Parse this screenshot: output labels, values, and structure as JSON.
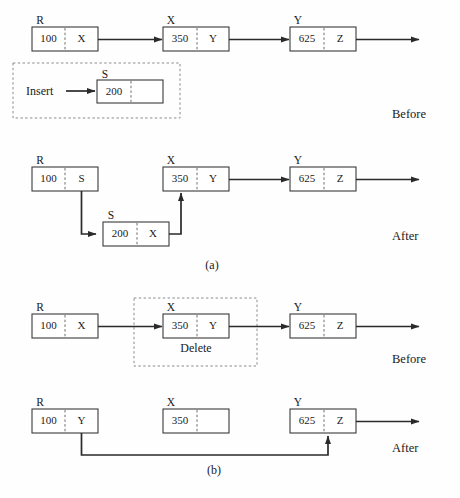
{
  "figure": {
    "subfigures": [
      {
        "id": "a",
        "label": "(a)",
        "operation": "Insert"
      },
      {
        "id": "b",
        "label": "(b)",
        "operation": "Delete"
      }
    ],
    "stage_labels": {
      "before": "Before",
      "after": "After"
    },
    "panel_labels": {
      "insert": "Insert",
      "delete": "Delete"
    }
  },
  "rows": {
    "a_before": {
      "stage": "Before",
      "nodes": [
        {
          "name": "R",
          "data": "100",
          "pointer": "X"
        },
        {
          "name": "X",
          "data": "350",
          "pointer": "Y"
        },
        {
          "name": "Y",
          "data": "625",
          "pointer": "Z"
        }
      ]
    },
    "a_insert_panel": {
      "action": "Insert",
      "node": {
        "name": "S",
        "data": "200",
        "pointer": ""
      }
    },
    "a_after": {
      "stage": "After",
      "nodes": [
        {
          "name": "R",
          "data": "100",
          "pointer": "S"
        },
        {
          "name": "X",
          "data": "350",
          "pointer": "Y"
        },
        {
          "name": "Y",
          "data": "625",
          "pointer": "Z"
        }
      ],
      "inserted_node": {
        "name": "S",
        "data": "200",
        "pointer": "X"
      }
    },
    "b_before": {
      "stage": "Before",
      "action": "Delete",
      "nodes": [
        {
          "name": "R",
          "data": "100",
          "pointer": "X"
        },
        {
          "name": "X",
          "data": "350",
          "pointer": "Y"
        },
        {
          "name": "Y",
          "data": "625",
          "pointer": "Z"
        }
      ]
    },
    "b_after": {
      "stage": "After",
      "nodes": [
        {
          "name": "R",
          "data": "100",
          "pointer": "Y"
        },
        {
          "name": "X",
          "data": "350",
          "pointer": ""
        },
        {
          "name": "Y",
          "data": "625",
          "pointer": "Z"
        }
      ]
    }
  },
  "colors": {
    "background": "#fefefe",
    "box_stroke": "#3a3a3a",
    "divider_stroke": "#6f6f6f",
    "link_stroke": "#2a2a2a",
    "dashed_stroke": "#8a8a8a",
    "text": "#1a1a1a"
  }
}
